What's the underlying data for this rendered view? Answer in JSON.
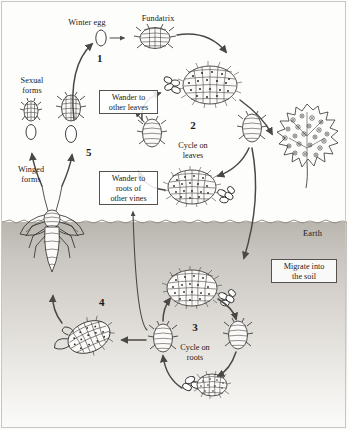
{
  "diagram": {
    "earth_label": "Earth",
    "labels": {
      "winter_egg": "Winter egg",
      "fundatrix": "Fundatrix",
      "sexual_forms": "Sexual\nforms",
      "winged_forms": "Winged\nforms"
    },
    "numbers": {
      "one": "1",
      "four": "4",
      "five": "5"
    },
    "stages": [
      {
        "id": "stage-2",
        "number": "2",
        "caption": "Cycle on\nleaves"
      },
      {
        "id": "stage-3",
        "number": "3",
        "caption": "Cycle on\nroots"
      }
    ],
    "callouts": [
      {
        "id": "wander-leaves",
        "text": "Wander to\nother leaves"
      },
      {
        "id": "wander-roots",
        "text": "Wander to\nroots of\nother vines"
      },
      {
        "id": "migrate-soil",
        "text": "Migrate into\nthe soil"
      }
    ],
    "colors": {
      "ink": "#2b2a28",
      "arrow": "#4a4845",
      "soil_top": "#b9b6b0",
      "soil_bottom": "#fbfbfa",
      "paper": "#fdfdfc",
      "frame": "#c9c6bf"
    }
  }
}
